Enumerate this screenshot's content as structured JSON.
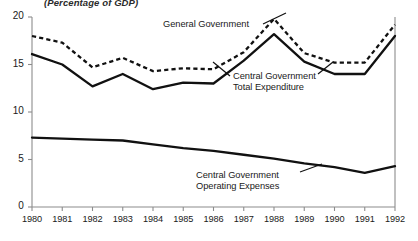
{
  "subtitle": "(Percentage of GDP)",
  "axis": {
    "y_ticks": [
      "20",
      "15",
      "10",
      "5",
      "0"
    ],
    "x_ticks": [
      "1980",
      "1981",
      "1982",
      "1983",
      "1984",
      "1985",
      "1986",
      "1987",
      "1988",
      "1989",
      "1990",
      "1991",
      "1992"
    ]
  },
  "annotations": {
    "general_government": "General Government",
    "central_total_line1": "Central Government",
    "central_total_line2": "Total Expenditure",
    "central_operating_line1": "Central Government",
    "central_operating_line2": "Operating Expenses"
  },
  "colors": {
    "line": "#111111",
    "axis": "#8c8c8c",
    "background": "#ffffff"
  },
  "chart_data": {
    "type": "line",
    "title": "",
    "subtitle": "(Percentage of GDP)",
    "xlabel": "",
    "ylabel": "",
    "ylim": [
      0,
      20
    ],
    "xlim": [
      1980,
      1992
    ],
    "grid": false,
    "legend_position": "inline-annotations",
    "x": [
      1980,
      1981,
      1982,
      1983,
      1984,
      1985,
      1986,
      1987,
      1988,
      1989,
      1990,
      1991,
      1992
    ],
    "series": [
      {
        "name": "General Government",
        "style": "dashed",
        "values": [
          18.0,
          17.3,
          14.7,
          15.7,
          14.3,
          14.6,
          14.5,
          16.3,
          19.8,
          16.2,
          15.2,
          15.2,
          19.2
        ]
      },
      {
        "name": "Central Government Total Expenditure",
        "style": "solid",
        "values": [
          16.1,
          15.0,
          12.7,
          14.0,
          12.4,
          13.1,
          13.0,
          15.4,
          18.2,
          15.3,
          14.0,
          14.0,
          18.0
        ]
      },
      {
        "name": "Central Government Operating Expenses",
        "style": "solid",
        "values": [
          7.3,
          7.2,
          7.1,
          7.0,
          6.6,
          6.2,
          5.9,
          5.5,
          5.1,
          4.6,
          4.2,
          3.6,
          4.3
        ]
      }
    ]
  }
}
